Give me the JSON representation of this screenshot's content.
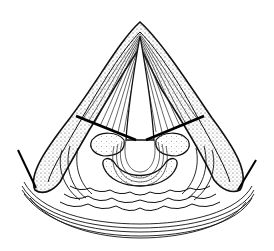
{
  "figure": {
    "type": "anatomical-line-drawing",
    "background": "#ffffff",
    "ink": "#111111",
    "stipple": "#555555"
  }
}
